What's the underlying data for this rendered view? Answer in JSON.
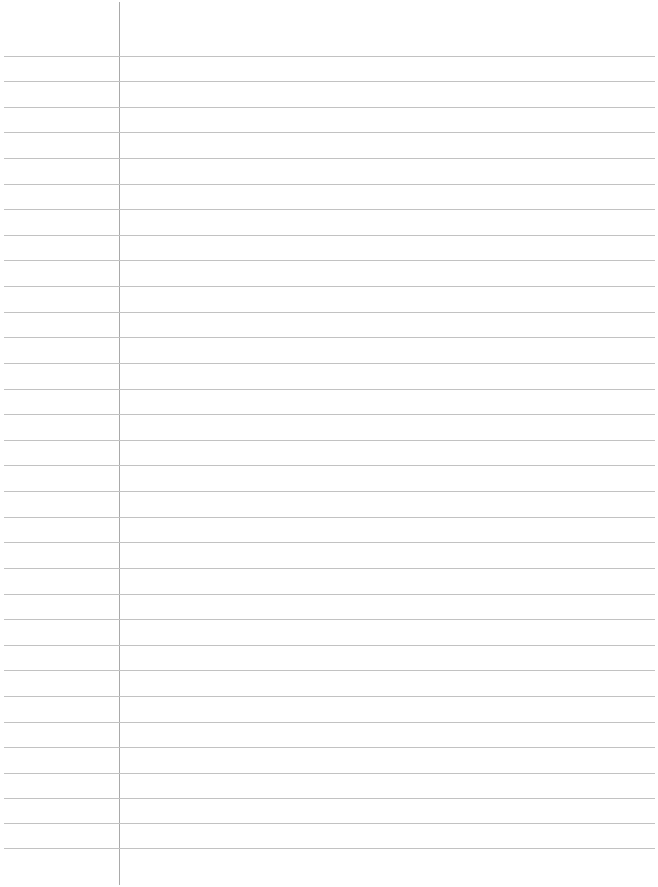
{
  "page": {
    "type": "lined-paper",
    "background_color": "#ffffff",
    "rule_color": "#c2c2c2",
    "margin_line_color": "#a9a9a9",
    "margin_line_x": 119,
    "rule_positions_y": [
      56,
      81,
      107,
      132,
      158,
      184,
      209,
      235,
      260,
      286,
      312,
      337,
      363,
      389,
      414,
      440,
      465,
      491,
      517,
      542,
      568,
      594,
      619,
      645,
      670,
      696,
      722,
      747,
      773,
      798,
      823,
      848
    ]
  }
}
